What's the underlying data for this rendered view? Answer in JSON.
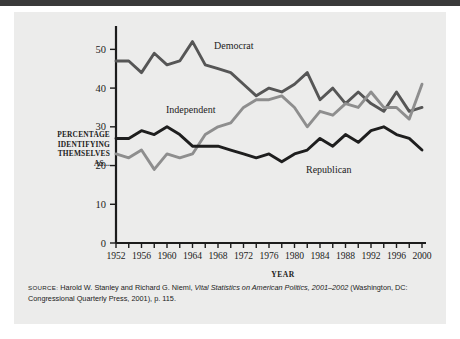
{
  "figure": {
    "y_axis_label_lines": [
      "PERCENTAGE",
      "IDENTIFYING",
      "THEMSELVES",
      "AS..."
    ],
    "x_axis_caption": "YEAR"
  },
  "source": {
    "prefix": "SOURCE:",
    "text_before_italic": " Harold W. Stanley and Richard G. Niemi, ",
    "italic_title": "Vital Statistics on American Politics, 2001–2002",
    "text_after_italic": " (Washington, DC: Congressional Quarterly Press, 2001), p. 115."
  },
  "colors": {
    "democrat": "#565656",
    "independent": "#8e8e8e",
    "republican": "#1e1e1e",
    "axis": "#1c1c1c",
    "card_background": "#ececeb",
    "page_background": "#ffffff",
    "top_bar": "#3a3a3a"
  },
  "chart_data": {
    "type": "line",
    "title": "",
    "xlabel": "YEAR",
    "ylabel": "PERCENTAGE IDENTIFYING THEMSELVES AS...",
    "xlim": [
      1952,
      2000
    ],
    "ylim": [
      0,
      55
    ],
    "yticks": [
      0,
      10,
      20,
      30,
      40,
      50
    ],
    "ytick_labels": [
      "0",
      "10",
      "20",
      "30",
      "40",
      "50"
    ],
    "xticks": [
      1952,
      1954,
      1956,
      1958,
      1960,
      1962,
      1964,
      1966,
      1968,
      1970,
      1972,
      1974,
      1976,
      1978,
      1980,
      1982,
      1984,
      1986,
      1988,
      1990,
      1992,
      1994,
      1996,
      1998,
      2000
    ],
    "xtick_labels_shown": [
      "1952",
      "1956",
      "1960",
      "1964",
      "1968",
      "1972",
      "1976",
      "1980",
      "1984",
      "1988",
      "1992",
      "1996",
      "2000"
    ],
    "grid": false,
    "legend_position": "inline-annotations",
    "x": [
      1952,
      1954,
      1956,
      1958,
      1960,
      1962,
      1964,
      1966,
      1968,
      1970,
      1972,
      1974,
      1976,
      1978,
      1980,
      1982,
      1984,
      1986,
      1988,
      1990,
      1992,
      1994,
      1996,
      1998,
      2000
    ],
    "series": [
      {
        "name": "Democrat",
        "color": "#565656",
        "values": [
          47,
          47,
          44,
          49,
          46,
          47,
          52,
          46,
          45,
          44,
          41,
          38,
          40,
          39,
          41,
          44,
          37,
          40,
          36,
          39,
          36,
          34,
          39,
          34,
          35
        ]
      },
      {
        "name": "Independent",
        "color": "#8e8e8e",
        "values": [
          23,
          22,
          24,
          19,
          23,
          22,
          23,
          28,
          30,
          31,
          35,
          37,
          37,
          38,
          35,
          30,
          34,
          33,
          36,
          35,
          39,
          35,
          35,
          32,
          41
        ]
      },
      {
        "name": "Republican",
        "color": "#1e1e1e",
        "values": [
          27,
          27,
          29,
          28,
          30,
          28,
          25,
          25,
          25,
          24,
          23,
          22,
          23,
          21,
          23,
          24,
          27,
          25,
          28,
          26,
          29,
          30,
          28,
          27,
          24
        ]
      }
    ],
    "annotations": [
      {
        "label": "Democrat",
        "x": 1966,
        "y": 53
      },
      {
        "label": "Independent",
        "x": 1960,
        "y": 33
      },
      {
        "label": "Republican",
        "x": 1984,
        "y": 20
      }
    ]
  }
}
